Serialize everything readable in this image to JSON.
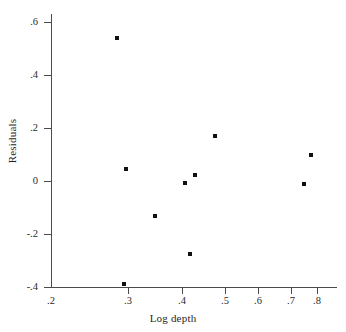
{
  "chart_data": {
    "type": "scatter",
    "title": "",
    "xlabel": "Log depth",
    "ylabel": "Residuals",
    "grid": false,
    "legend": null,
    "xlim": [
      0.2,
      0.85
    ],
    "ylim": [
      -0.4,
      0.6
    ],
    "x_scale": "log",
    "y_scale": "linear",
    "xticks": [
      ".2",
      ".3",
      ".4",
      ".5",
      ".6",
      ".7",
      ".8"
    ],
    "xtick_values": [
      0.2,
      0.3,
      0.4,
      0.5,
      0.6,
      0.7,
      0.8
    ],
    "yticks": [
      ".6",
      ".4",
      ".2",
      "0",
      "-.2",
      "-.4"
    ],
    "ytick_values": [
      0.6,
      0.4,
      0.2,
      0,
      -0.2,
      -0.4
    ],
    "marker": "square",
    "marker_color": "#111111",
    "axis_color": "#4a4a4a",
    "background": "#ffffff",
    "points": [
      {
        "x": 0.285,
        "y": 0.545
      },
      {
        "x": 0.288,
        "y": -0.385
      },
      {
        "x": 0.29,
        "y": 0.037
      },
      {
        "x": 0.343,
        "y": -0.135
      },
      {
        "x": 0.405,
        "y": -0.018
      },
      {
        "x": 0.412,
        "y": -0.275
      },
      {
        "x": 0.421,
        "y": 0.018
      },
      {
        "x": 0.463,
        "y": 0.172
      },
      {
        "x": 0.735,
        "y": -0.022
      },
      {
        "x": 0.767,
        "y": 0.09
      }
    ]
  },
  "axis_layout": {
    "x_pixel_map": [
      {
        "label": ".2",
        "px": 51
      },
      {
        "label": ".3",
        "px": 128
      },
      {
        "label": ".4",
        "px": 182
      },
      {
        "label": ".5",
        "px": 225
      },
      {
        "label": ".6",
        "px": 258
      },
      {
        "label": ".7",
        "px": 291
      },
      {
        "label": ".8",
        "px": 317
      }
    ],
    "y_pixel_map": [
      {
        "label": ".6",
        "px": 22
      },
      {
        "label": ".4",
        "px": 75
      },
      {
        "label": ".2",
        "px": 128
      },
      {
        "label": "0",
        "px": 181
      },
      {
        "label": "-.2",
        "px": 234
      },
      {
        "label": "-.4",
        "px": 287
      }
    ],
    "point_pixels": [
      {
        "px": 117,
        "py": 38
      },
      {
        "px": 124,
        "py": 284
      },
      {
        "px": 126,
        "py": 169
      },
      {
        "px": 155,
        "py": 216
      },
      {
        "px": 185,
        "py": 183
      },
      {
        "px": 190,
        "py": 254
      },
      {
        "px": 195,
        "py": 175
      },
      {
        "px": 215,
        "py": 136
      },
      {
        "px": 304,
        "py": 184
      },
      {
        "px": 311,
        "py": 155
      }
    ]
  }
}
